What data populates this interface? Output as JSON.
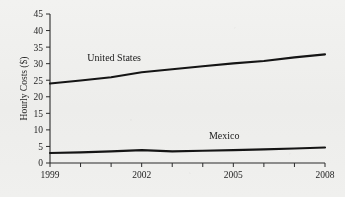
{
  "chart_data": {
    "type": "line",
    "title": "",
    "xlabel": "",
    "ylabel": "Hourly Costs ($)",
    "xlim": [
      1999,
      2008
    ],
    "ylim": [
      0,
      45
    ],
    "grid": false,
    "legend_position": "inline-labels",
    "x": [
      1999,
      2000,
      2001,
      2002,
      2003,
      2004,
      2005,
      2006,
      2007,
      2008
    ],
    "x_tick_labels": [
      "1999",
      "2002",
      "2005",
      "2008"
    ],
    "x_tick_values": [
      1999,
      2002,
      2005,
      2008
    ],
    "x_minor_ticks": [
      2000,
      2001,
      2003,
      2004,
      2006,
      2007
    ],
    "y_tick_labels": [
      "0",
      "5",
      "10",
      "15",
      "20",
      "25",
      "30",
      "35",
      "40",
      "45"
    ],
    "y_tick_values": [
      0,
      5,
      10,
      15,
      20,
      25,
      30,
      35,
      40,
      45
    ],
    "series": [
      {
        "name": "United States",
        "label_x": 2001.1,
        "label_y": 30.7,
        "values": [
          24.0,
          24.9,
          25.9,
          27.4,
          28.3,
          29.2,
          30.1,
          30.8,
          31.9,
          32.8
        ]
      },
      {
        "name": "Mexico",
        "label_x": 2004.7,
        "label_y": 7.2,
        "values": [
          3.0,
          3.2,
          3.5,
          3.9,
          3.5,
          3.7,
          3.9,
          4.1,
          4.4,
          4.7
        ]
      }
    ]
  }
}
